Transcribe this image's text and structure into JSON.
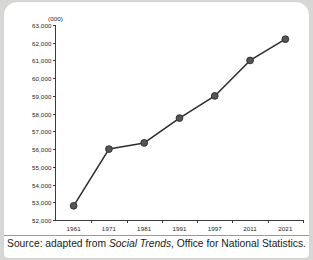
{
  "card": {
    "caption_prefix": "Source: adapted from ",
    "caption_italic": "Social Trends",
    "caption_suffix": ", Office for National Statistics."
  },
  "chart_data": {
    "type": "line",
    "title": "",
    "subtitle": "",
    "units_label": "(000)",
    "xlabel": "",
    "ylabel": "",
    "categories": [
      "1961",
      "1971",
      "1981",
      "1991",
      "1997",
      "2011",
      "2021"
    ],
    "values": [
      52800,
      56000,
      56350,
      57750,
      59000,
      61000,
      62200
    ],
    "series": [
      {
        "name": "UK population",
        "values": [
          52800,
          56000,
          56350,
          57750,
          59000,
          61000,
          62200
        ]
      }
    ],
    "ylim": [
      52000,
      63000
    ],
    "ytick_values": [
      52000,
      53000,
      54000,
      55000,
      56000,
      57000,
      58000,
      59000,
      60000,
      61000,
      62000,
      63000
    ],
    "ytick_labels": [
      "52,000",
      "53,000",
      "54,000",
      "55,000",
      "56,000",
      "57,000",
      "58,000",
      "59,000",
      "60,000",
      "61,000",
      "62,000",
      "63,000"
    ],
    "grid": false,
    "legend": "none",
    "line_color": "#2b2b2b",
    "marker_color": "#555555",
    "marker_edge_color": "#2b2b2b",
    "axis_color": "#3a3a3a"
  }
}
